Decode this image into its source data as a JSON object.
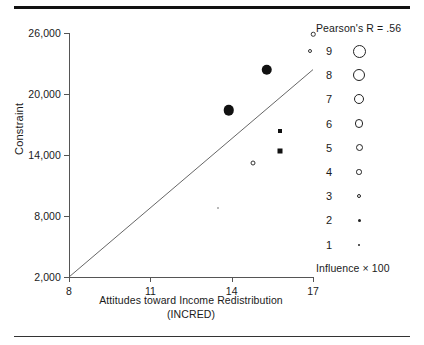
{
  "chart_data": {
    "type": "scatter",
    "title": "",
    "xlabel": "Attitudes toward Income Redistribution",
    "xlabel_line2": "(INCRED)",
    "ylabel": "Constraint",
    "xlim": [
      8,
      17
    ],
    "ylim": [
      2000,
      26000
    ],
    "xticks": [
      "8",
      "11",
      "14",
      "17"
    ],
    "xtick_values": [
      8,
      11,
      14,
      17
    ],
    "yticks": [
      "26,000",
      "20,000",
      "14,000",
      "8,000",
      "2,000"
    ],
    "ytick_values": [
      26000,
      20000,
      14000,
      8000,
      2000
    ],
    "grid": false,
    "annotation": "Pearson's R = .56",
    "regression_line": {
      "x1": 8,
      "y1": 2000,
      "x2": 17,
      "y2": 22400
    },
    "size_encoding": "Influence × 100",
    "points": [
      {
        "x": 15.3,
        "y": 22400,
        "size": 9,
        "style": "filled-circle",
        "px": 10.5
      },
      {
        "x": 13.9,
        "y": 18400,
        "size": 9,
        "style": "filled-circle",
        "px": 10.5
      },
      {
        "x": 15.8,
        "y": 16400,
        "size": 3,
        "style": "filled-square",
        "px": 4
      },
      {
        "x": 15.8,
        "y": 14400,
        "size": 4,
        "style": "filled-square",
        "px": 5
      },
      {
        "x": 14.8,
        "y": 13200,
        "size": 4,
        "style": "open-circle",
        "px": 5
      },
      {
        "x": 17.0,
        "y": 25900,
        "size": 3,
        "style": "open-circle",
        "px": 4.5
      },
      {
        "x": 16.9,
        "y": 24200,
        "size": 3,
        "style": "open-circle",
        "px": 4
      },
      {
        "x": 13.5,
        "y": 8800,
        "size": 1,
        "style": "faint",
        "px": 2
      }
    ],
    "legend": {
      "title": "Influence × 100",
      "entries": [
        {
          "label": "9",
          "diameter": 13
        },
        {
          "label": "8",
          "diameter": 12
        },
        {
          "label": "7",
          "diameter": 10
        },
        {
          "label": "6",
          "diameter": 8.5
        },
        {
          "label": "5",
          "diameter": 7
        },
        {
          "label": "4",
          "diameter": 5.5
        },
        {
          "label": "3",
          "diameter": 4.5
        },
        {
          "label": "2",
          "diameter": 3
        },
        {
          "label": "1",
          "diameter": 2
        }
      ]
    }
  },
  "colors": {
    "ink": "#1a1a1a",
    "marker": "#111111",
    "axis": "#555555",
    "rule": "#111111",
    "faint": "#b9b9b9"
  }
}
